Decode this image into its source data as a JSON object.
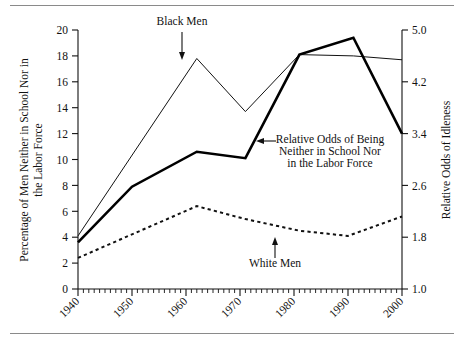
{
  "figure": {
    "name": "idleness-trends-chart"
  },
  "chart_data": {
    "type": "line",
    "title": "",
    "xlabel": "",
    "ylabel": "Percentage of Men Neither in School Nor in the Labor Force",
    "y2label": "Relative Odds of Idleness",
    "xlim": [
      1940,
      2000
    ],
    "ylim": [
      0,
      20
    ],
    "y2lim": [
      1.0,
      5.0
    ],
    "grid": false,
    "legend": "annotations",
    "xticks": [
      "1940",
      "1950",
      "1960",
      "1970",
      "1980",
      "1990",
      "2000"
    ],
    "xtick_values": [
      1940,
      1950,
      1960,
      1970,
      1980,
      1990,
      2000
    ],
    "xminor_tick_interval": 1,
    "yticks": [
      "0",
      "2",
      "4",
      "6",
      "8",
      "10",
      "12",
      "14",
      "16",
      "18",
      "20"
    ],
    "ytick_values": [
      0,
      2,
      4,
      6,
      8,
      10,
      12,
      14,
      16,
      18,
      20
    ],
    "y2ticks": [
      "1.0",
      "1.8",
      "2.6",
      "3.4",
      "4.2",
      "5.0"
    ],
    "y2tick_values": [
      1.0,
      1.8,
      2.6,
      3.4,
      4.2,
      5.0
    ],
    "series": [
      {
        "name": "Black Men",
        "axis": "left",
        "style": "thin-solid",
        "color": "#111111",
        "x": [
          1940,
          1962,
          1971,
          1981,
          1991,
          2000
        ],
        "values": [
          4.1,
          17.8,
          13.7,
          18.1,
          18.0,
          17.7
        ]
      },
      {
        "name": "White Men",
        "axis": "left",
        "style": "dotted",
        "color": "#111111",
        "x": [
          1940,
          1962,
          1971,
          1981,
          1990,
          2000
        ],
        "values": [
          2.4,
          6.4,
          5.4,
          4.5,
          4.1,
          5.6
        ]
      },
      {
        "name": "Relative Odds of Being Neither in School Nor in the Labor Force",
        "axis": "right",
        "style": "bold-solid",
        "color": "#000000",
        "x": [
          1940,
          1950,
          1962,
          1971,
          1981,
          1991,
          2000
        ],
        "values_right_axis": [
          1.79,
          2.58,
          2.93,
          2.85,
          4.62,
          4.79,
          3.4
        ],
        "values_left_scale": [
          3.6,
          7.9,
          10.6,
          10.1,
          18.1,
          19.4,
          12.0
        ]
      }
    ],
    "annotations": [
      {
        "label": "Black Men",
        "points_to": "black-men-line",
        "arrow": "down"
      },
      {
        "label": "White Men",
        "points_to": "white-men-line",
        "arrow": "up"
      },
      {
        "label": "Relative Odds of Being",
        "points_to": "relative-odds-line",
        "arrow": "left"
      },
      {
        "label": "Neither in School Nor",
        "points_to": "relative-odds-line",
        "arrow": "none"
      },
      {
        "label": "in the Labor Force",
        "points_to": "relative-odds-line",
        "arrow": "none"
      }
    ]
  },
  "axes": {
    "left_title_line1": "Percentage of Men Neither in School Nor in",
    "left_title_line2": "the Labor Force",
    "right_title": "Relative Odds of Idleness"
  },
  "annotations": {
    "black_men": "Black Men",
    "white_men": "White Men",
    "odds_line1": "Relative Odds of Being",
    "odds_line2": "Neither in School Nor",
    "odds_line3": "in the Labor Force"
  }
}
